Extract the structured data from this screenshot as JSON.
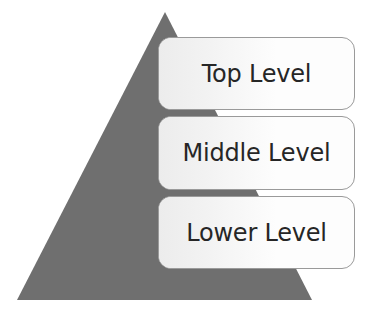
{
  "diagram": {
    "shape": {
      "name": "triangle",
      "fill_color": "#6f6f6f",
      "apex": "165,12",
      "base_left": "17,300",
      "base_right": "312,300"
    },
    "levels": [
      {
        "id": "top",
        "label": "Top Level",
        "box_fill": "#fdfdfd",
        "box_border": "#9a9a9a",
        "text_color": "#262626"
      },
      {
        "id": "middle",
        "label": "Middle Level",
        "box_fill": "#fdfdfd",
        "box_border": "#9a9a9a",
        "text_color": "#262626"
      },
      {
        "id": "lower",
        "label": "Lower Level",
        "box_fill": "#fdfdfd",
        "box_border": "#9a9a9a",
        "text_color": "#262626"
      }
    ]
  }
}
